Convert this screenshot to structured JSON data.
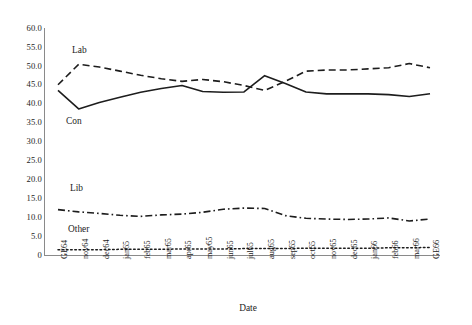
{
  "chart_data": {
    "type": "line",
    "title": "",
    "xlabel": "Date",
    "ylabel": "",
    "ylim": [
      0,
      60
    ],
    "ytick_step": 5,
    "grid": false,
    "legend_position": "inline-labels",
    "yticks": [
      "60.0",
      "55.0",
      "50.0",
      "45.0",
      "40.0",
      "35.0",
      "30.0",
      "25.0",
      "20.0",
      "15.0",
      "10.0",
      "5.0",
      "0"
    ],
    "categories": [
      "GE64",
      "nov64",
      "dec64",
      "jan65",
      "feb65",
      "mar65",
      "apr65",
      "may65",
      "jun65",
      "jul65",
      "aug65",
      "sep65",
      "oct65",
      "nov65",
      "dec65",
      "jan66",
      "feb66",
      "mar66",
      "GE66"
    ],
    "series": [
      {
        "name": "Con",
        "style": "solid",
        "color": "#1d1d1d",
        "values": [
          43.5,
          38.6,
          40.3,
          41.7,
          43.0,
          44.0,
          44.8,
          43.2,
          43.0,
          43.1,
          47.4,
          45.3,
          43.1,
          42.6,
          42.6,
          42.6,
          42.4,
          41.9,
          42.6
        ]
      },
      {
        "name": "Lab",
        "style": "dashed",
        "color": "#1d1d1d",
        "values": [
          45.0,
          50.4,
          49.7,
          48.6,
          47.5,
          46.6,
          45.9,
          46.4,
          45.8,
          44.8,
          43.5,
          45.9,
          48.6,
          48.9,
          48.9,
          49.2,
          49.5,
          50.6,
          49.5
        ]
      },
      {
        "name": "Lib",
        "style": "dashdot",
        "color": "#1d1d1d",
        "values": [
          12.0,
          11.4,
          11.0,
          10.5,
          10.2,
          10.6,
          10.8,
          11.3,
          12.1,
          12.4,
          12.3,
          10.4,
          9.7,
          9.5,
          9.4,
          9.5,
          9.8,
          9.0,
          9.5
        ]
      },
      {
        "name": "Other",
        "style": "dotted",
        "color": "#1d1d1d",
        "values": [
          1.4,
          1.4,
          1.4,
          1.5,
          1.5,
          1.5,
          1.6,
          1.6,
          1.6,
          1.7,
          1.7,
          1.7,
          1.8,
          1.8,
          1.8,
          1.8,
          1.9,
          1.9,
          2.0
        ]
      }
    ],
    "series_label_annotations": [
      {
        "name": "Lab",
        "text": "Lab"
      },
      {
        "name": "Con",
        "text": "Con"
      },
      {
        "name": "Lib",
        "text": "Lib"
      },
      {
        "name": "Other",
        "text": "Other"
      }
    ]
  }
}
